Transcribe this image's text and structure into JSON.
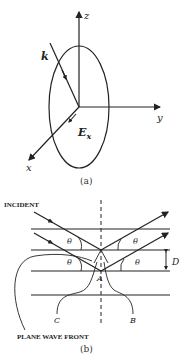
{
  "figure_a": {
    "caption": "(a)",
    "axes": {
      "z": "z",
      "y": "y",
      "x": "x"
    },
    "wave_vector_label": "k",
    "field_label": "E",
    "field_subscript": "x"
  },
  "figure_b": {
    "caption": "(b)",
    "incident_label": "INCIDENT",
    "plane_wave_front_label": "PLANE WAVE FRONT",
    "angle_label": "θ",
    "spacing_label": "D",
    "point_labels": {
      "A": "A",
      "B": "B",
      "C": "C"
    }
  }
}
